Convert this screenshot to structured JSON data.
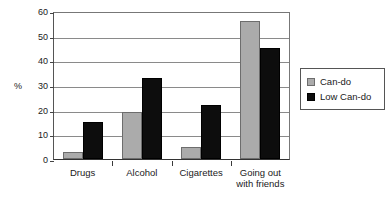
{
  "chart_data": {
    "type": "bar",
    "title": "",
    "subtitle": "",
    "xlabel": "",
    "ylabel": "%",
    "ylim": [
      0,
      60
    ],
    "ytick_step": 10,
    "yticks": [
      0,
      10,
      20,
      30,
      40,
      50,
      60
    ],
    "ytick_labels": [
      "0",
      "10",
      "20",
      "30",
      "40",
      "50",
      "60"
    ],
    "grid": true,
    "grid_axis": "y",
    "legend_position": "right",
    "categories": [
      "Drugs",
      "Alcohol",
      "Cigarettes",
      "Going out with friends"
    ],
    "category_label_lines": [
      [
        "Drugs"
      ],
      [
        "Alcohol"
      ],
      [
        "Cigarettes"
      ],
      [
        "Going out",
        "with friends"
      ]
    ],
    "series": [
      {
        "name": "Can-do",
        "color": "#ababab",
        "values": [
          3,
          19,
          5,
          56
        ]
      },
      {
        "name": "Low Can-do",
        "color": "#0d0d0d",
        "values": [
          15,
          33,
          22,
          45
        ]
      }
    ],
    "annotations": []
  },
  "legend": {
    "items": [
      {
        "label": "Can-do",
        "swatch": "can-do"
      },
      {
        "label": "Low Can-do",
        "swatch": "low-can-do"
      }
    ]
  },
  "axis": {
    "y_title": "%"
  }
}
